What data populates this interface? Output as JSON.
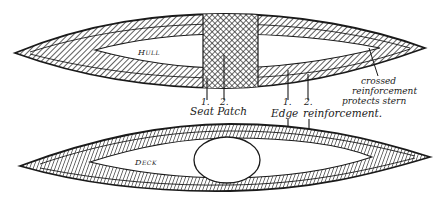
{
  "diagram": {
    "panels": {
      "hull": {
        "label": "Hull"
      },
      "deck": {
        "label": "Deck"
      }
    },
    "callouts": {
      "seat_patch": {
        "num1": "1.",
        "num2": "2.",
        "text": "Seat Patch"
      },
      "edge_reinforcement": {
        "num1": "1.",
        "num2": "2.",
        "text_a": "Edge",
        "text_b": "reinforcement."
      },
      "stern_note": {
        "line1": "crossed",
        "line2": "reinforcement",
        "line3": "protects stern"
      }
    },
    "colors": {
      "ink": "#1a1a1a",
      "paper": "#ffffff"
    }
  }
}
